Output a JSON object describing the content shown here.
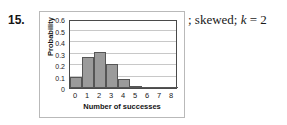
{
  "item": {
    "number": "15."
  },
  "answer": {
    "prefix": "; skewed; ",
    "variable": "k",
    "equals": " = ",
    "value": "2"
  },
  "chart_data": {
    "type": "bar",
    "title": "",
    "xlabel": "Number of successes",
    "ylabel": "Probability",
    "categories": [
      "0",
      "1",
      "2",
      "3",
      "4",
      "5",
      "6",
      "7",
      "8"
    ],
    "values": [
      0.1,
      0.27,
      0.31,
      0.21,
      0.08,
      0.02,
      0.004,
      0.0,
      0.0
    ],
    "ylim": [
      0,
      0.6
    ],
    "yticks": [
      "0",
      "0.1",
      "0.2",
      "0.3",
      "0.4",
      "0.5",
      "0.6"
    ],
    "ytick_values": [
      0,
      0.1,
      0.2,
      0.3,
      0.4,
      0.5,
      0.6
    ],
    "xlim": [
      -0.5,
      8.5
    ],
    "grid": true,
    "grid_axis": "y",
    "legend": false,
    "bar_fill": "#9b9b9b",
    "bar_edge": "#565656",
    "frame_color": "#4a4a4a",
    "grid_color": "#c8c8c8"
  }
}
